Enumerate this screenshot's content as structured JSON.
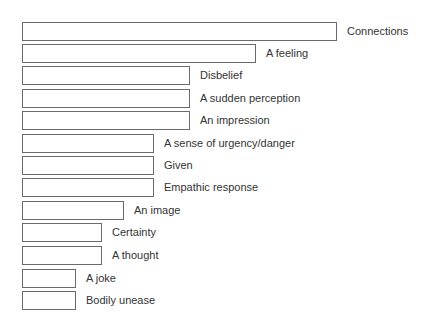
{
  "chart_data": {
    "type": "bar",
    "orientation": "horizontal",
    "title": "",
    "xlabel": "",
    "ylabel": "",
    "grid": false,
    "legend": null,
    "value_note": "No numeric axis or data labels shown; values are relative bar lengths (px).",
    "categories": [
      "Connections",
      "A feeling",
      "Disbelief",
      "A sudden perception",
      "An impression",
      "A sense of urgency/danger",
      "Given",
      "Empathic response",
      "An image",
      "Certainty",
      "A thought",
      "A joke",
      "Bodily unease"
    ],
    "values": [
      315,
      234,
      168,
      168,
      168,
      132,
      132,
      132,
      102,
      80,
      80,
      54,
      54
    ],
    "bar_style": {
      "fill": "#ffffff",
      "border": "#6a6a6a"
    },
    "label_color": "#333333"
  },
  "rows": [
    {
      "label": "Connections",
      "width": 315,
      "top": 21
    },
    {
      "label": "A feeling",
      "width": 234,
      "top": 43
    },
    {
      "label": "Disbelief",
      "width": 168,
      "top": 65
    },
    {
      "label": "A sudden perception",
      "width": 168,
      "top": 88
    },
    {
      "label": "An impression",
      "width": 168,
      "top": 110
    },
    {
      "label": "A sense of urgency/danger",
      "width": 132,
      "top": 133
    },
    {
      "label": "Given",
      "width": 132,
      "top": 155
    },
    {
      "label": "Empathic response",
      "width": 132,
      "top": 177
    },
    {
      "label": "An image",
      "width": 102,
      "top": 200
    },
    {
      "label": "Certainty",
      "width": 80,
      "top": 222
    },
    {
      "label": "A thought",
      "width": 80,
      "top": 245
    },
    {
      "label": "A joke",
      "width": 54,
      "top": 268
    },
    {
      "label": "Bodily unease",
      "width": 54,
      "top": 290
    }
  ]
}
